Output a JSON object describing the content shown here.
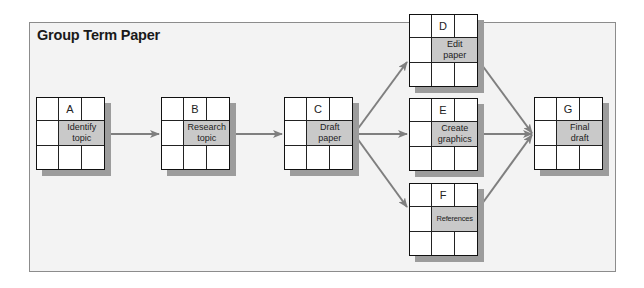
{
  "title": "Group Term Paper",
  "colors": {
    "panel_fill": "#f3f3f3",
    "panel_border": "#8c8c8c",
    "task_cell": "#c9c9c9",
    "arrow": "#7f7f7f",
    "shadow": "#9c9c9c"
  },
  "nodes": [
    {
      "id": "A",
      "letter": "A",
      "task_line1": "Identify",
      "task_line2": "topic"
    },
    {
      "id": "B",
      "letter": "B",
      "task_line1": "Research",
      "task_line2": "topic"
    },
    {
      "id": "C",
      "letter": "C",
      "task_line1": "Draft",
      "task_line2": "paper"
    },
    {
      "id": "D",
      "letter": "D",
      "task_line1": "Edit",
      "task_line2": "paper"
    },
    {
      "id": "E",
      "letter": "E",
      "task_line1": "Create",
      "task_line2": "graphics"
    },
    {
      "id": "F",
      "letter": "F",
      "task_line1": "References",
      "task_line2": ""
    },
    {
      "id": "G",
      "letter": "G",
      "task_line1": "Final",
      "task_line2": "draft"
    }
  ],
  "edges": [
    {
      "from": "A",
      "to": "B"
    },
    {
      "from": "B",
      "to": "C"
    },
    {
      "from": "C",
      "to": "D"
    },
    {
      "from": "C",
      "to": "E"
    },
    {
      "from": "C",
      "to": "F"
    },
    {
      "from": "D",
      "to": "G"
    },
    {
      "from": "E",
      "to": "G"
    },
    {
      "from": "F",
      "to": "G"
    }
  ]
}
